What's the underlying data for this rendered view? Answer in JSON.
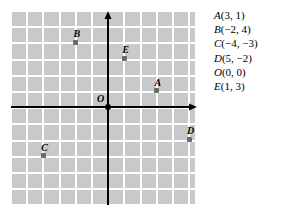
{
  "figure": {
    "type": "coordinate-plane-diagram",
    "grid": {
      "cell_size_px": 16.2,
      "columns": 11,
      "rows": 12,
      "grid_color": "#ffffff",
      "cell_color": "#c9c9c9",
      "axis_color": "#000000"
    },
    "axes": {
      "x_axis_name": "x-axis",
      "y_axis_name": "y-axis",
      "x_range": [
        -6,
        5
      ],
      "y_range": [
        -6,
        6
      ]
    },
    "origin_label": "O",
    "points": [
      {
        "name": "A",
        "label": "A",
        "x": 3,
        "y": 1,
        "color": "#6b6b6b"
      },
      {
        "name": "B",
        "label": "B",
        "x": -2,
        "y": 4,
        "color": "#6b6b6b"
      },
      {
        "name": "C",
        "label": "C",
        "x": -4,
        "y": -3,
        "color": "#6b6b6b"
      },
      {
        "name": "D",
        "label": "D",
        "x": 5,
        "y": -2,
        "color": "#6b6b6b"
      },
      {
        "name": "O",
        "label": "O",
        "x": 0,
        "y": 0,
        "color": "#000000"
      },
      {
        "name": "E",
        "label": "E",
        "x": 1,
        "y": 3,
        "color": "#6b6b6b"
      }
    ]
  },
  "coordinate_list": {
    "title": "",
    "items": [
      {
        "name": "A",
        "coords": "(3, 1)",
        "text": "A(3, 1)"
      },
      {
        "name": "B",
        "coords": "(−2, 4)",
        "text": "B(−2, 4)"
      },
      {
        "name": "C",
        "coords": "(−4, −3)",
        "text": "C(−4, −3)"
      },
      {
        "name": "D",
        "coords": "(5, −2)",
        "text": "D(5, −2)"
      },
      {
        "name": "O",
        "coords": "(0, 0)",
        "text": "O(0, 0)"
      },
      {
        "name": "E",
        "coords": "(1, 3)",
        "text": "E(1, 3)"
      }
    ]
  },
  "chart_data": {
    "type": "scatter",
    "title": "",
    "xlabel": "",
    "ylabel": "",
    "xlim": [
      -6,
      5
    ],
    "ylim": [
      -6,
      6
    ],
    "grid": true,
    "legend": "none",
    "labels": [
      "A",
      "B",
      "C",
      "D",
      "O",
      "E"
    ],
    "x": [
      3,
      -2,
      -4,
      5,
      0,
      1
    ],
    "y": [
      1,
      4,
      -3,
      -2,
      0,
      3
    ],
    "annotations": [
      "A(3, 1)",
      "B(−2, 4)",
      "C(−4, −3)",
      "D(5, −2)",
      "O(0, 0)",
      "E(1, 3)"
    ]
  }
}
